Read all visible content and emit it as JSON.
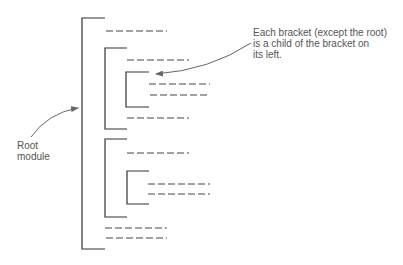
{
  "annotations": {
    "child_note": {
      "lines": [
        "Each bracket (except the root)",
        "is a child of the bracket on",
        "its left."
      ]
    },
    "root_note": {
      "lines": [
        "Root",
        "module"
      ]
    }
  },
  "colors": {
    "stroke": "#333333",
    "arrow": "#666666",
    "text": "#555555"
  },
  "tree": {
    "label": "Root module",
    "children": [
      {
        "type": "statement"
      },
      {
        "type": "bracket",
        "children": [
          {
            "type": "statement"
          },
          {
            "type": "bracket",
            "children": [
              {
                "type": "statement"
              },
              {
                "type": "statement"
              }
            ]
          },
          {
            "type": "statement"
          }
        ]
      },
      {
        "type": "bracket",
        "children": [
          {
            "type": "statement"
          },
          {
            "type": "bracket",
            "children": [
              {
                "type": "statement"
              },
              {
                "type": "statement"
              }
            ]
          }
        ]
      },
      {
        "type": "statement"
      },
      {
        "type": "statement"
      }
    ]
  }
}
